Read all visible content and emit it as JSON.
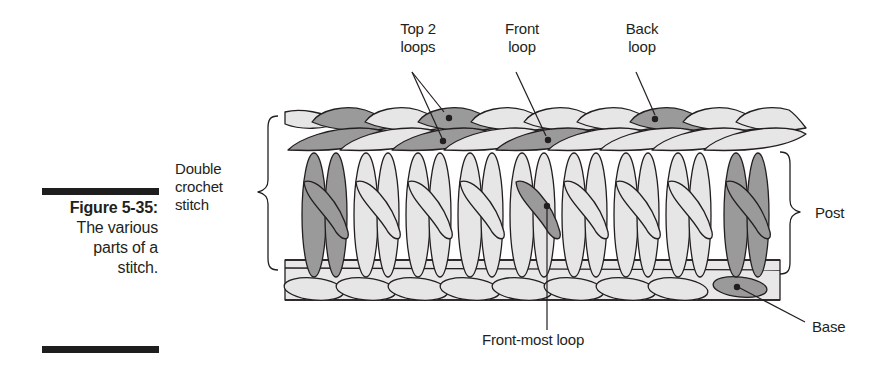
{
  "figure": {
    "number_label": "Figure 5-35:",
    "caption": "The various parts of a stitch.",
    "caption_lines": [
      "The various",
      "parts of a",
      "stitch."
    ]
  },
  "labels": {
    "top_two_loops": [
      "Top 2",
      "loops"
    ],
    "front_loop": [
      "Front",
      "loop"
    ],
    "back_loop": [
      "Back",
      "loop"
    ],
    "double_crochet_stitch": [
      "Double",
      "crochet",
      "stitch"
    ],
    "post": "Post",
    "base": "Base",
    "front_most_loop": "Front-most loop"
  },
  "colors": {
    "light_yarn": "#e6e6e6",
    "dark_yarn": "#9a9a9a",
    "outline": "#231f20",
    "text": "#231f20",
    "bar": "#1e1e1e"
  },
  "diagram": {
    "stitch_count": 8,
    "highlighted": [
      "first stitch post",
      "last stitch post",
      "top 2 loops on stitch 3",
      "front loop on stitch 5",
      "back loop on stitch 7",
      "front-most loop on stitch 5 post",
      "base under stitch 8"
    ]
  }
}
